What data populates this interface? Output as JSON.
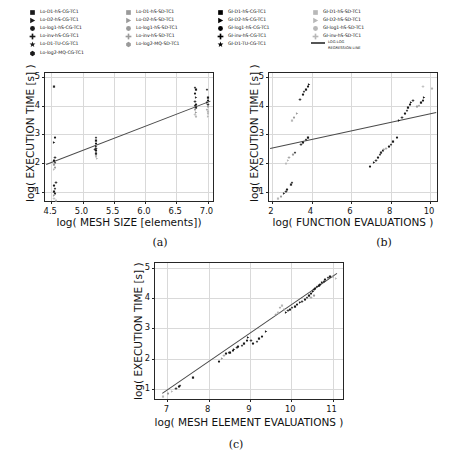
{
  "legend": {
    "columns": [
      {
        "items": [
          {
            "label": "Lo-D1-hS-CG-TC1",
            "marker": "square",
            "color": "#1a1a1a"
          },
          {
            "label": "Lo-D2-hS-CG-TC1",
            "marker": "triangle-right",
            "color": "#1a1a1a"
          },
          {
            "label": "Lo-log1-hS-CG-TC1",
            "marker": "circle",
            "color": "#1a1a1a"
          },
          {
            "label": "Lo-inv-hS-CG-TC1",
            "marker": "plus",
            "color": "#1a1a1a"
          },
          {
            "label": "Lo-D1-TU-CG-TC1",
            "marker": "star",
            "color": "#1a1a1a"
          },
          {
            "label": "Lo-log2-MQ-CG-TC1",
            "marker": "hexagon",
            "color": "#1a1a1a"
          }
        ]
      },
      {
        "items": [
          {
            "label": "Lo-D1-hS-SD-TC1",
            "marker": "square",
            "color": "#9a9a9a"
          },
          {
            "label": "Lo-D2-hS-SD-TC1",
            "marker": "triangle-right",
            "color": "#9a9a9a"
          },
          {
            "label": "Lo-log1-hS-SD-TC1",
            "marker": "circle",
            "color": "#9a9a9a"
          },
          {
            "label": "Lo-inv-hS-SD-TC1",
            "marker": "plus",
            "color": "#9a9a9a"
          },
          {
            "label": "Lo-log2-MQ-SD-TC1",
            "marker": "hexagon",
            "color": "#9a9a9a"
          }
        ]
      },
      {
        "items": [
          {
            "label": "GI-D1-hS-CG-TC1",
            "marker": "square",
            "color": "#000000"
          },
          {
            "label": "GI-D2-hS-CG-TC1",
            "marker": "triangle-right",
            "color": "#000000"
          },
          {
            "label": "GI-log1-hS-CG-TC1",
            "marker": "circle",
            "color": "#000000"
          },
          {
            "label": "GI-inv-hS-CG-TC1",
            "marker": "plus",
            "color": "#000000"
          },
          {
            "label": "GI-D1-TU-CG-TC1",
            "marker": "star",
            "color": "#000000"
          }
        ]
      },
      {
        "items": [
          {
            "label": "GI-D1-hS-SD-TC1",
            "marker": "square",
            "color": "#b8b8b8"
          },
          {
            "label": "GI-D2-hS-SD-TC1",
            "marker": "triangle-right",
            "color": "#b8b8b8"
          },
          {
            "label": "GI-log1-hS-SD-TC1",
            "marker": "circle",
            "color": "#b8b8b8"
          },
          {
            "label": "GI-inv-hS-SD-TC1",
            "marker": "plus",
            "color": "#b8b8b8"
          }
        ]
      }
    ],
    "line_entry": {
      "line1": "LOG-LOG",
      "line2": "REGRESSION LINE",
      "color": "#555555"
    }
  },
  "captions": {
    "a": "(a)",
    "b": "(b)",
    "c": "(c)"
  },
  "chart_data": [
    {
      "id": "a",
      "type": "scatter",
      "title": "",
      "xlabel": "log( MESH SIZE [elements])",
      "ylabel": "log( EXECUTION TIME [s] )",
      "xlim": [
        4.4,
        7.12
      ],
      "ylim": [
        0.6,
        5.15
      ],
      "xticks": [
        4.5,
        5.0,
        5.5,
        6.0,
        6.5,
        7.0
      ],
      "xticklabels": [
        "4.5",
        "5.0",
        "5.5",
        "6.0",
        "6.5",
        "7.0"
      ],
      "yticks": [
        1,
        2,
        3,
        4,
        5
      ],
      "yticklabels": [
        "1",
        "2",
        "3",
        "4",
        "5"
      ],
      "grid": true,
      "legend_position": "above-figure",
      "regression": {
        "label": "LOG-LOG REGRESSION LINE",
        "x0": 4.42,
        "y0": 1.95,
        "x1": 7.05,
        "y1": 4.17
      },
      "points": [
        [
          4.55,
          4.8,
          "#2a2a2a"
        ],
        [
          4.56,
          3.0,
          "#1a1a1a"
        ],
        [
          4.55,
          2.85,
          "#1a1a1a"
        ],
        [
          4.56,
          2.32,
          "#1a1a1a"
        ],
        [
          4.55,
          2.22,
          "#1a1a1a"
        ],
        [
          4.56,
          2.12,
          "#2a2a2a"
        ],
        [
          4.55,
          2.05,
          "#9a9a9a"
        ],
        [
          4.56,
          1.96,
          "#9a9a9a"
        ],
        [
          4.54,
          1.88,
          "#b8b8b8"
        ],
        [
          4.57,
          1.42,
          "#1a1a1a"
        ],
        [
          4.55,
          1.32,
          "#1a1a1a"
        ],
        [
          4.56,
          1.22,
          "#1a1a1a"
        ],
        [
          4.55,
          1.12,
          "#1a1a1a"
        ],
        [
          4.56,
          1.05,
          "#2a2a2a"
        ],
        [
          4.55,
          0.98,
          "#9a9a9a"
        ],
        [
          4.54,
          0.88,
          "#b8b8b8"
        ],
        [
          4.57,
          0.82,
          "#b8b8b8"
        ],
        [
          5.21,
          3.0,
          "#1a1a1a"
        ],
        [
          5.22,
          2.9,
          "#1a1a1a"
        ],
        [
          5.21,
          2.8,
          "#1a1a1a"
        ],
        [
          5.22,
          2.7,
          "#2a2a2a"
        ],
        [
          5.21,
          2.62,
          "#1a1a1a"
        ],
        [
          5.22,
          2.56,
          "#1a1a1a"
        ],
        [
          5.21,
          2.5,
          "#9a9a9a"
        ],
        [
          5.22,
          2.42,
          "#9a9a9a"
        ],
        [
          5.21,
          2.35,
          "#b8b8b8"
        ],
        [
          5.23,
          2.28,
          "#b8b8b8"
        ],
        [
          5.2,
          2.58,
          "#1a1a1a"
        ],
        [
          5.22,
          2.46,
          "#2a2a2a"
        ],
        [
          6.8,
          4.75,
          "#1a1a1a"
        ],
        [
          6.81,
          4.68,
          "#1a1a1a"
        ],
        [
          6.8,
          4.55,
          "#1a1a1a"
        ],
        [
          6.82,
          4.4,
          "#2a2a2a"
        ],
        [
          6.8,
          4.28,
          "#1a1a1a"
        ],
        [
          6.81,
          4.18,
          "#1a1a1a"
        ],
        [
          6.8,
          4.12,
          "#1a1a1a"
        ],
        [
          6.82,
          4.05,
          "#2a2a2a"
        ],
        [
          6.8,
          3.98,
          "#9a9a9a"
        ],
        [
          6.81,
          3.9,
          "#9a9a9a"
        ],
        [
          6.8,
          3.82,
          "#b8b8b8"
        ],
        [
          6.82,
          3.76,
          "#b8b8b8"
        ],
        [
          6.99,
          4.68,
          "#1a1a1a"
        ],
        [
          7.0,
          4.4,
          "#1a1a1a"
        ],
        [
          7.01,
          4.32,
          "#1a1a1a"
        ],
        [
          6.99,
          4.24,
          "#2a2a2a"
        ],
        [
          7.0,
          4.16,
          "#1a1a1a"
        ],
        [
          7.01,
          4.08,
          "#9a9a9a"
        ],
        [
          6.99,
          4.0,
          "#9a9a9a"
        ],
        [
          7.0,
          3.92,
          "#b8b8b8"
        ],
        [
          7.01,
          3.84,
          "#b8b8b8"
        ],
        [
          7.0,
          3.74,
          "#b8b8b8"
        ]
      ]
    },
    {
      "id": "b",
      "type": "scatter",
      "title": "",
      "xlabel": "log( FUNCTION EVALUATIONS )",
      "ylabel": "log( EXECUTION TIME [s] )",
      "xlim": [
        1.85,
        10.45
      ],
      "ylim": [
        0.6,
        5.15
      ],
      "xticks": [
        2,
        4,
        6,
        8,
        10
      ],
      "xticklabels": [
        "2",
        "4",
        "6",
        "8",
        "10"
      ],
      "yticks": [
        1,
        2,
        3,
        4,
        5
      ],
      "yticklabels": [
        "1",
        "2",
        "3",
        "4",
        "5"
      ],
      "grid": true,
      "legend_position": "above-figure",
      "regression": {
        "label": "LOG-LOG REGRESSION LINE",
        "x0": 1.9,
        "y0": 2.52,
        "x1": 10.3,
        "y1": 3.78
      },
      "points": [
        [
          2.32,
          0.88,
          "#b8b8b8"
        ],
        [
          2.45,
          0.95,
          "#9a9a9a"
        ],
        [
          2.62,
          1.05,
          "#2a2a2a"
        ],
        [
          2.7,
          1.12,
          "#1a1a1a"
        ],
        [
          2.78,
          1.18,
          "#1a1a1a"
        ],
        [
          3.0,
          1.42,
          "#1a1a1a"
        ],
        [
          2.95,
          1.38,
          "#2a2a2a"
        ],
        [
          2.7,
          2.1,
          "#b8b8b8"
        ],
        [
          2.8,
          2.22,
          "#b8b8b8"
        ],
        [
          2.88,
          2.32,
          "#9a9a9a"
        ],
        [
          3.05,
          2.42,
          "#9a9a9a"
        ],
        [
          3.18,
          2.5,
          "#1a1a1a"
        ],
        [
          3.02,
          3.6,
          "#b8b8b8"
        ],
        [
          3.12,
          3.72,
          "#9a9a9a"
        ],
        [
          3.28,
          3.85,
          "#9a9a9a"
        ],
        [
          3.4,
          4.35,
          "#1a1a1a"
        ],
        [
          3.55,
          4.52,
          "#1a1a1a"
        ],
        [
          3.62,
          4.62,
          "#1a1a1a"
        ],
        [
          3.72,
          4.7,
          "#1a1a1a"
        ],
        [
          3.8,
          4.8,
          "#1a1a1a"
        ],
        [
          3.88,
          4.85,
          "#1a1a1a"
        ],
        [
          3.45,
          2.78,
          "#1a1a1a"
        ],
        [
          3.58,
          2.82,
          "#1a1a1a"
        ],
        [
          3.7,
          2.95,
          "#1a1a1a"
        ],
        [
          3.8,
          3.02,
          "#1a1a1a"
        ],
        [
          6.95,
          1.98,
          "#1a1a1a"
        ],
        [
          7.18,
          2.12,
          "#1a1a1a"
        ],
        [
          7.28,
          2.22,
          "#1a1a1a"
        ],
        [
          7.38,
          2.32,
          "#1a1a1a"
        ],
        [
          7.45,
          2.4,
          "#1a1a1a"
        ],
        [
          7.52,
          2.48,
          "#2a2a2a"
        ],
        [
          7.6,
          2.55,
          "#1a1a1a"
        ],
        [
          7.68,
          2.6,
          "#9a9a9a"
        ],
        [
          7.78,
          2.62,
          "#9a9a9a"
        ],
        [
          7.92,
          2.68,
          "#1a1a1a"
        ],
        [
          8.02,
          2.78,
          "#1a1a1a"
        ],
        [
          8.1,
          2.88,
          "#1a1a1a"
        ],
        [
          8.32,
          3.02,
          "#1a1a1a"
        ],
        [
          8.45,
          3.62,
          "#1a1a1a"
        ],
        [
          8.6,
          3.72,
          "#1a1a1a"
        ],
        [
          8.72,
          3.85,
          "#1a1a1a"
        ],
        [
          8.82,
          3.95,
          "#1a1a1a"
        ],
        [
          8.9,
          4.05,
          "#1a1a1a"
        ],
        [
          8.98,
          4.15,
          "#1a1a1a"
        ],
        [
          9.05,
          4.22,
          "#1a1a1a"
        ],
        [
          9.12,
          4.32,
          "#1a1a1a"
        ],
        [
          9.35,
          4.08,
          "#9a9a9a"
        ],
        [
          9.42,
          4.12,
          "#9a9a9a"
        ],
        [
          9.55,
          4.25,
          "#1a1a1a"
        ],
        [
          9.62,
          4.32,
          "#1a1a1a"
        ],
        [
          9.68,
          4.4,
          "#1a1a1a"
        ],
        [
          9.62,
          4.8,
          "#b8b8b8"
        ],
        [
          10.12,
          4.72,
          "#b8b8b8"
        ]
      ]
    },
    {
      "id": "c",
      "type": "scatter",
      "title": "",
      "xlabel": "log( MESH ELEMENT EVALUATIONS )",
      "ylabel": "log( EXECUTION TIME [s] )",
      "xlim": [
        6.7,
        11.3
      ],
      "ylim": [
        0.6,
        5.15
      ],
      "xticks": [
        7,
        8,
        9,
        10,
        11
      ],
      "xticklabels": [
        "7",
        "8",
        "9",
        "10",
        "11"
      ],
      "yticks": [
        1,
        2,
        3,
        4,
        5
      ],
      "yticklabels": [
        "1",
        "2",
        "3",
        "4",
        "5"
      ],
      "grid": true,
      "legend_position": "above-figure",
      "regression": {
        "label": "LOG-LOG REGRESSION LINE",
        "x0": 6.88,
        "y0": 0.85,
        "x1": 11.1,
        "y1": 4.8
      },
      "points": [
        [
          6.9,
          0.85,
          "#b8b8b8"
        ],
        [
          7.02,
          0.95,
          "#9a9a9a"
        ],
        [
          7.1,
          1.02,
          "#b8b8b8"
        ],
        [
          7.22,
          1.12,
          "#1a1a1a"
        ],
        [
          7.28,
          1.18,
          "#1a1a1a"
        ],
        [
          7.3,
          1.22,
          "#1a1a1a"
        ],
        [
          7.62,
          1.5,
          "#1a1a1a"
        ],
        [
          8.25,
          2.02,
          "#1a1a1a"
        ],
        [
          8.32,
          2.12,
          "#9a9a9a"
        ],
        [
          8.38,
          2.22,
          "#9a9a9a"
        ],
        [
          8.42,
          2.28,
          "#1a1a1a"
        ],
        [
          8.48,
          2.3,
          "#1a1a1a"
        ],
        [
          8.52,
          2.32,
          "#1a1a1a"
        ],
        [
          8.58,
          2.36,
          "#1a1a1a"
        ],
        [
          8.62,
          2.42,
          "#1a1a1a"
        ],
        [
          8.68,
          2.46,
          "#1a1a1a"
        ],
        [
          8.72,
          2.5,
          "#1a1a1a"
        ],
        [
          8.8,
          2.55,
          "#1a1a1a"
        ],
        [
          8.86,
          2.6,
          "#1a1a1a"
        ],
        [
          8.92,
          2.72,
          "#1a1a1a"
        ],
        [
          8.96,
          2.8,
          "#1a1a1a"
        ],
        [
          9.02,
          2.7,
          "#1a1a1a"
        ],
        [
          9.08,
          2.62,
          "#1a1a1a"
        ],
        [
          9.16,
          2.68,
          "#1a1a1a"
        ],
        [
          9.22,
          2.78,
          "#1a1a1a"
        ],
        [
          9.28,
          2.85,
          "#1a1a1a"
        ],
        [
          9.38,
          3.0,
          "#1a1a1a"
        ],
        [
          9.62,
          3.55,
          "#9a9a9a"
        ],
        [
          9.68,
          3.62,
          "#b8b8b8"
        ],
        [
          9.72,
          3.8,
          "#9a9a9a"
        ],
        [
          9.78,
          3.85,
          "#b8b8b8"
        ],
        [
          9.82,
          3.72,
          "#9a9a9a"
        ],
        [
          9.88,
          3.62,
          "#1a1a1a"
        ],
        [
          9.92,
          3.68,
          "#1a1a1a"
        ],
        [
          9.98,
          3.72,
          "#1a1a1a"
        ],
        [
          10.02,
          3.78,
          "#1a1a1a"
        ],
        [
          10.08,
          3.82,
          "#1a1a1a"
        ],
        [
          10.14,
          3.88,
          "#1a1a1a"
        ],
        [
          10.2,
          3.95,
          "#1a1a1a"
        ],
        [
          10.26,
          4.0,
          "#1a1a1a"
        ],
        [
          10.32,
          4.05,
          "#1a1a1a"
        ],
        [
          10.38,
          4.12,
          "#1a1a1a"
        ],
        [
          10.42,
          4.18,
          "#1a1a1a"
        ],
        [
          10.48,
          4.25,
          "#1a1a1a"
        ],
        [
          10.52,
          4.32,
          "#1a1a1a"
        ],
        [
          10.56,
          4.38,
          "#1a1a1a"
        ],
        [
          10.58,
          4.42,
          "#1a1a1a"
        ],
        [
          10.62,
          4.48,
          "#1a1a1a"
        ],
        [
          10.66,
          4.52,
          "#1a1a1a"
        ],
        [
          10.7,
          4.55,
          "#1a1a1a"
        ],
        [
          10.74,
          4.6,
          "#1a1a1a"
        ],
        [
          10.78,
          4.65,
          "#1a1a1a"
        ],
        [
          10.82,
          4.72,
          "#1a1a1a"
        ],
        [
          10.88,
          4.78,
          "#1a1a1a"
        ],
        [
          10.94,
          4.82,
          "#1a1a1a"
        ],
        [
          11.02,
          4.8,
          "#9a9a9a"
        ],
        [
          11.08,
          4.76,
          "#b8b8b8"
        ],
        [
          10.48,
          4.12,
          "#9a9a9a"
        ],
        [
          10.55,
          4.2,
          "#9a9a9a"
        ]
      ]
    }
  ]
}
